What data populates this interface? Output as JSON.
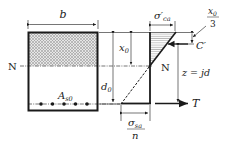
{
  "diagram": {
    "type": "reinforced concrete beam cross-section with stress distribution",
    "section": {
      "width_label": "b",
      "neutral_axis_label": "N",
      "steel_area_label": "A",
      "steel_area_sub": "s0",
      "bar_count": 5
    },
    "dimensions": {
      "compression_depth_label": "x",
      "compression_depth_sub": "0",
      "effective_depth_label": "d",
      "effective_depth_sub": "0",
      "lever_arm_label": "z = jd",
      "resultant_offset_num": "x",
      "resultant_offset_num_sub": "0",
      "resultant_offset_den": "3"
    },
    "stress": {
      "concrete_stress_label": "σ′",
      "concrete_stress_sub": "ca",
      "steel_stress_num": "σ",
      "steel_stress_num_sub": "sa",
      "steel_stress_den": "n",
      "neutral_axis_label": "N"
    },
    "forces": {
      "compression_label": "C′",
      "tension_label": "T"
    },
    "colors": {
      "line": "#1a1a1a",
      "hatch": "#9a9a9a"
    }
  }
}
